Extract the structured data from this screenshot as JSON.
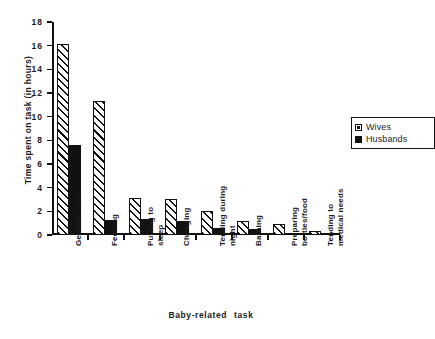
{
  "chart_data": {
    "type": "bar",
    "title": "",
    "xlabel": "Baby-related  task",
    "ylabel": "Time spent on task (in hours)",
    "ylim": [
      0,
      18
    ],
    "ytick_step": 2,
    "yticks": [
      "0",
      "2",
      "4",
      "6",
      "8",
      "10",
      "12",
      "14",
      "16",
      "18"
    ],
    "grid": false,
    "legend_position": "top-right",
    "categories": [
      "General care",
      "Feeding",
      "Putting to sleep",
      "Changing",
      "Tending during night",
      "Bathing",
      "Preparing bottles/food",
      "Tending to medical needs"
    ],
    "category_lines": [
      [
        "General care"
      ],
      [
        "Feeding"
      ],
      [
        "Putting to",
        "sleep"
      ],
      [
        "Changing"
      ],
      [
        "Tending during",
        "night"
      ],
      [
        "Bathing"
      ],
      [
        "Preparing",
        "bottles/food"
      ],
      [
        "Tending to",
        "medical needs"
      ]
    ],
    "series": [
      {
        "name": "Wives",
        "color": "#ffffff",
        "pattern": "diagonal-hatch",
        "values": [
          16.1,
          11.3,
          3.15,
          3.05,
          2.0,
          1.2,
          0.95,
          0.3
        ]
      },
      {
        "name": "Husbands",
        "color": "#111111",
        "pattern": "solid",
        "values": [
          7.6,
          1.3,
          1.35,
          1.15,
          0.6,
          0.5,
          0.2,
          0.05
        ]
      }
    ]
  },
  "legend": {
    "items": [
      {
        "label": "Wives"
      },
      {
        "label": "Husbands"
      }
    ]
  }
}
